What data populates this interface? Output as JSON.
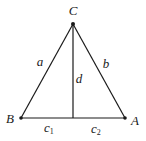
{
  "diagram": {
    "type": "triangle-with-altitude",
    "vertices": {
      "C": {
        "label": "C",
        "x": 73,
        "y": 24,
        "label_x": 73,
        "label_y": 15
      },
      "B": {
        "label": "B",
        "x": 21,
        "y": 118,
        "label_x": 10,
        "label_y": 123
      },
      "A": {
        "label": "A",
        "x": 125,
        "y": 118,
        "label_x": 135,
        "label_y": 125
      }
    },
    "foot": {
      "x": 73,
      "y": 118
    },
    "sides": {
      "a": {
        "label": "a",
        "x": 40,
        "y": 66
      },
      "b": {
        "label": "b",
        "x": 106,
        "y": 68
      },
      "d": {
        "label": "d",
        "x": 79,
        "y": 83
      }
    },
    "segments": {
      "c1": {
        "base": "c",
        "sub": "1",
        "x": 46,
        "y": 132
      },
      "c2": {
        "base": "c",
        "sub": "2",
        "x": 93,
        "y": 133
      }
    },
    "colors": {
      "line": "#1a1a1a",
      "background": "#ffffff"
    }
  }
}
